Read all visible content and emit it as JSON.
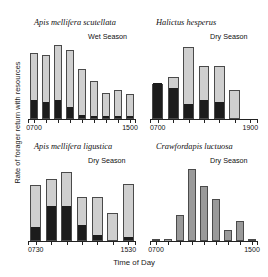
{
  "figure": {
    "xlabel": "Time of Day",
    "ylabel": "Rate of forager return with resources"
  },
  "chart_data": {
    "type": "bar",
    "xlabel": "Time of Day",
    "ylabel": "Rate of forager return with resources",
    "grid": false,
    "legend": false,
    "stacked": true,
    "series_names": [
      "with resources (dark)",
      "total returns (light)"
    ],
    "panels": [
      {
        "id": "apis-mellifera-scutellata",
        "title": "Apis mellifera scutellata",
        "season": "Wet Season",
        "tick_labels": [
          "0700",
          "1500"
        ],
        "tick_positions": [
          0,
          8
        ],
        "categories": [
          "0700",
          "0800",
          "0900",
          "1000",
          "1100",
          "1200",
          "1300",
          "1400",
          "1500"
        ],
        "series": [
          {
            "name": "dark",
            "values": [
              22,
              20,
              22,
              14,
              4,
              3,
              2,
              3,
              2
            ]
          },
          {
            "name": "light",
            "values": [
              82,
              80,
              92,
              86,
              62,
              47,
              33,
              36,
              31
            ]
          }
        ],
        "ylim": [
          0,
          100
        ]
      },
      {
        "id": "halictus-hesperus",
        "title": "Halictus hesperus",
        "season": "Dry Season",
        "tick_labels": [
          "0700",
          "1900"
        ],
        "tick_positions": [
          0,
          6
        ],
        "categories": [
          "0700",
          "0900",
          "1100",
          "1300",
          "1500",
          "1700",
          "1900"
        ],
        "series": [
          {
            "name": "dark",
            "values": [
              44,
              37,
              17,
              22,
              20,
              0,
              0
            ]
          },
          {
            "name": "light",
            "values": [
              44,
              53,
              90,
              66,
              66,
              36,
              0
            ]
          }
        ],
        "ylim": [
          0,
          100
        ]
      },
      {
        "id": "apis-mellifera-ligustica",
        "title": "Apis mellifera ligustica",
        "season": "Dry Season",
        "tick_labels": [
          "0730",
          "1530"
        ],
        "tick_positions": [
          0,
          6
        ],
        "categories": [
          "0730",
          "0900",
          "1030",
          "1200",
          "1330",
          "1430",
          "1530"
        ],
        "series": [
          {
            "name": "dark",
            "values": [
              17,
              44,
              43,
              19,
              7,
              0,
              4
            ]
          },
          {
            "name": "light",
            "values": [
              72,
              80,
              88,
              57,
              56,
              36,
              73
            ]
          }
        ],
        "ylim": [
          0,
          100
        ]
      },
      {
        "id": "crawfordapis-luctuosa",
        "title": "Crawfordapis luctuosa",
        "season": "Dry Season",
        "tick_labels": [
          "0700",
          "1500"
        ],
        "tick_positions": [
          0,
          8
        ],
        "categories": [
          "0700",
          "0800",
          "0900",
          "1000",
          "1100",
          "1200",
          "1300",
          "1400",
          "1500"
        ],
        "series": [
          {
            "name": "dark",
            "values": [
              0,
              0,
              0,
              0,
              0,
              0,
              0,
              0,
              0
            ]
          },
          {
            "name": "light",
            "values": [
              2,
              3,
              33,
              92,
              70,
              54,
              14,
              26,
              2
            ]
          }
        ],
        "ylim": [
          0,
          100
        ]
      }
    ]
  }
}
